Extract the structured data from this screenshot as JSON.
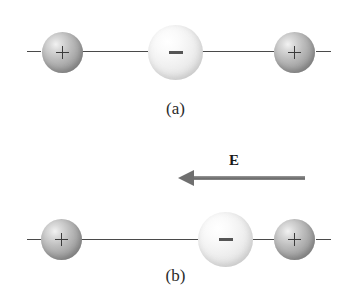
{
  "figure": {
    "background_color": "#ffffff"
  },
  "panels": [
    {
      "id": "a",
      "caption": "(a)",
      "field_present": false,
      "charges": [
        {
          "sign": "+",
          "label": "+",
          "name": "positive-charge-left"
        },
        {
          "sign": "−",
          "label": "−",
          "name": "negative-charge-center"
        },
        {
          "sign": "+",
          "label": "+",
          "name": "positive-charge-right"
        }
      ]
    },
    {
      "id": "b",
      "caption": "(b)",
      "field_present": true,
      "field": {
        "label": "E",
        "direction": "left",
        "color": "#6f6f6f"
      },
      "charges": [
        {
          "sign": "+",
          "label": "+",
          "name": "positive-charge-left"
        },
        {
          "sign": "−",
          "label": "−",
          "name": "negative-charge-center"
        },
        {
          "sign": "+",
          "label": "+",
          "name": "positive-charge-right"
        }
      ]
    }
  ],
  "colors": {
    "positive_sphere": "#a3a3a3",
    "negative_sphere": "#e8e8e8",
    "bond_line": "#4a4a4a",
    "sign_mark": "#3b3b3b",
    "arrow": "#6f6f6f",
    "caption_text": "#2b2b2b"
  }
}
